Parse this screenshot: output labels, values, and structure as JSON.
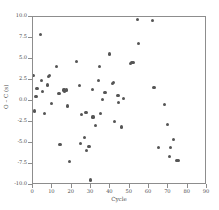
{
  "chart_data": {
    "type": "scatter",
    "title": "",
    "xlabel": "Cycle",
    "ylabel": "O – C (s)",
    "xlim": [
      0,
      90
    ],
    "ylim": [
      -10.0,
      10.0
    ],
    "grid": false,
    "legend": "none",
    "marker": {
      "shape": "circle",
      "color": "#555555",
      "size": 3.2
    },
    "xticks": [
      0,
      10,
      20,
      30,
      40,
      50,
      60,
      70,
      80,
      90
    ],
    "xtick_labels": [
      "0",
      "10",
      "20",
      "30",
      "40",
      "50",
      "60",
      "70",
      "80",
      "90"
    ],
    "yticks": [
      -10.0,
      -7.5,
      -5.0,
      -2.5,
      0.0,
      2.5,
      5.0,
      7.5,
      10.0
    ],
    "ytick_labels": [
      "-10.0",
      "-7.5",
      "-5.0",
      "-2.5",
      "0.0",
      "2.5",
      "5.0",
      "7.5",
      "10.0"
    ],
    "series": [
      {
        "name": "O - C residuals",
        "points": [
          [
            0.4,
            3.0
          ],
          [
            0.6,
            -1.2
          ],
          [
            1.6,
            0.5
          ],
          [
            2.1,
            1.5
          ],
          [
            4.0,
            7.9
          ],
          [
            4.3,
            2.4
          ],
          [
            5.0,
            1.1
          ],
          [
            6.0,
            -1.5
          ],
          [
            7.4,
            1.9
          ],
          [
            8.2,
            2.9
          ],
          [
            8.5,
            3.0
          ],
          [
            9.6,
            -0.3
          ],
          [
            12.0,
            4.1
          ],
          [
            13.4,
            0.9
          ],
          [
            14.0,
            -5.2
          ],
          [
            16.0,
            1.3
          ],
          [
            16.4,
            1.2
          ],
          [
            17.4,
            1.3
          ],
          [
            18.0,
            -0.6
          ],
          [
            19.0,
            -7.2
          ],
          [
            22.6,
            4.7
          ],
          [
            24.0,
            1.8
          ],
          [
            24.7,
            -5.1
          ],
          [
            25.2,
            -1.6
          ],
          [
            26.5,
            -4.3
          ],
          [
            27.4,
            -1.4
          ],
          [
            27.8,
            -5.9
          ],
          [
            29.0,
            -5.4
          ],
          [
            29.6,
            -9.4
          ],
          [
            30.6,
            1.4
          ],
          [
            31.0,
            -1.9
          ],
          [
            32.3,
            -2.9
          ],
          [
            33.8,
            2.4
          ],
          [
            34.4,
            4.1
          ],
          [
            34.8,
            -1.5
          ],
          [
            36.0,
            0.2
          ],
          [
            37.2,
            1.0
          ],
          [
            39.4,
            5.6
          ],
          [
            41.2,
            2.1
          ],
          [
            41.6,
            2.2
          ],
          [
            42.0,
            -2.4
          ],
          [
            44.0,
            0.7
          ],
          [
            44.4,
            -0.2
          ],
          [
            45.6,
            -3.1
          ],
          [
            47.0,
            0.3
          ],
          [
            50.5,
            4.5
          ],
          [
            51.0,
            4.6
          ],
          [
            51.6,
            4.6
          ],
          [
            52.0,
            4.6
          ],
          [
            54.0,
            9.7
          ],
          [
            54.4,
            6.8
          ],
          [
            62.0,
            9.6
          ],
          [
            62.5,
            1.6
          ],
          [
            62.9,
            1.6
          ],
          [
            65.0,
            -5.5
          ],
          [
            68.0,
            -0.4
          ],
          [
            69.4,
            -2.8
          ],
          [
            70.6,
            -6.6
          ],
          [
            71.2,
            -5.5
          ],
          [
            72.6,
            -4.6
          ],
          [
            74.2,
            -7.1
          ],
          [
            75.0,
            -7.1
          ]
        ]
      }
    ]
  }
}
